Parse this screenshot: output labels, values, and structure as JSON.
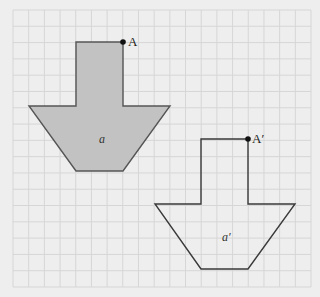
{
  "diagram": {
    "type": "translation-on-grid",
    "background_color": "#eeeeee",
    "grid": {
      "x0": 13,
      "y0": 10,
      "x1": 311,
      "y1": 287,
      "cols": 19,
      "rows": 17,
      "line_color": "#d6d6d6"
    },
    "shapes": [
      {
        "id": "a",
        "label": "a",
        "filled": true,
        "fill_color": "#c2c2c2",
        "points": [
          [
            76,
            42
          ],
          [
            123,
            42
          ],
          [
            123,
            106
          ],
          [
            170,
            106
          ],
          [
            123,
            171
          ],
          [
            76,
            171
          ],
          [
            29,
            106
          ],
          [
            76,
            106
          ]
        ],
        "label_pos": [
          99,
          143
        ]
      },
      {
        "id": "a_prime",
        "label": "a′",
        "filled": false,
        "points": [
          [
            201,
            139
          ],
          [
            248,
            139
          ],
          [
            248,
            204
          ],
          [
            295,
            204
          ],
          [
            248,
            269
          ],
          [
            201,
            269
          ],
          [
            155,
            204
          ],
          [
            201,
            204
          ]
        ],
        "label_pos": [
          222,
          241
        ]
      }
    ],
    "points": [
      {
        "id": "A",
        "label": "A",
        "x": 123,
        "y": 42,
        "label_dx": 5,
        "label_dy": 4
      },
      {
        "id": "A_prime",
        "label": "A′",
        "x": 248,
        "y": 139,
        "label_dx": 4,
        "label_dy": 4
      }
    ]
  }
}
